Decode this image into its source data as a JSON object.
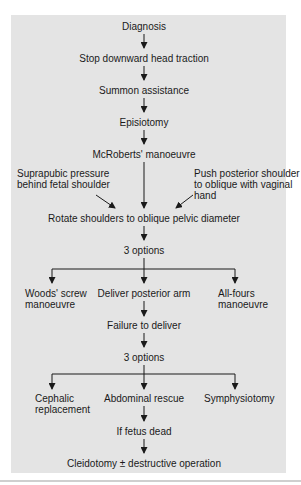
{
  "diagram": {
    "type": "flowchart",
    "colors": {
      "panel_background": "#e4e4e4",
      "text": "#1a1a1a",
      "arrow": "#1a1a1a"
    },
    "nodes": {
      "diagnosis": "Diagnosis",
      "stop_traction": "Stop downward head traction",
      "summon": "Summon assistance",
      "episiotomy": "Episiotomy",
      "mcroberts": "McRoberts' manoeuvre",
      "suprapubic_line1": "Suprapubic pressure",
      "suprapubic_line2": "behind fetal shoulder",
      "push_line1": "Push posterior shoulder",
      "push_line2": "to oblique with vaginal",
      "push_line3": "hand",
      "rotate": "Rotate shoulders to oblique pelvic diameter",
      "options1": "3 options",
      "woods_line1": "Woods' screw",
      "woods_line2": "manoeuvre",
      "posterior_arm": "Deliver posterior arm",
      "allfours_line1": "All-fours",
      "allfours_line2": "manoeuvre",
      "failure": "Failure to deliver",
      "options2": "3 options",
      "cephalic_line1": "Cephalic",
      "cephalic_line2": "replacement",
      "abdominal": "Abdominal rescue",
      "symphysiotomy": "Symphysiotomy",
      "fetus_dead": "If fetus dead",
      "cleidotomy": "Cleidotomy ± destructive operation"
    },
    "edges": [
      [
        "diagnosis",
        "stop_traction"
      ],
      [
        "stop_traction",
        "summon"
      ],
      [
        "summon",
        "episiotomy"
      ],
      [
        "episiotomy",
        "mcroberts"
      ],
      [
        "mcroberts",
        "rotate"
      ],
      [
        "suprapubic",
        "rotate"
      ],
      [
        "push",
        "rotate"
      ],
      [
        "rotate",
        "options1"
      ],
      [
        "options1",
        "woods"
      ],
      [
        "options1",
        "posterior_arm"
      ],
      [
        "options1",
        "allfours"
      ],
      [
        "posterior_arm",
        "failure"
      ],
      [
        "failure",
        "options2"
      ],
      [
        "options2",
        "cephalic"
      ],
      [
        "options2",
        "abdominal"
      ],
      [
        "options2",
        "symphysiotomy"
      ],
      [
        "abdominal",
        "fetus_dead"
      ],
      [
        "fetus_dead",
        "cleidotomy"
      ]
    ]
  }
}
